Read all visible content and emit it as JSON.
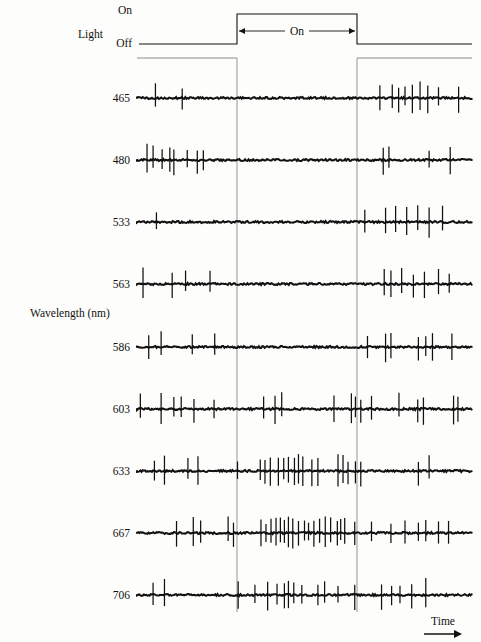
{
  "figure": {
    "y_axis_label": "Wavelength  (nm)",
    "x_axis_label": "Time",
    "stimulus_label": "Light",
    "stimulus_on_label": "On",
    "stimulus_off_label": "Off",
    "stimulus_span_label": "On",
    "ink_color": "#111111",
    "guide_color": "#8a8a8a"
  },
  "chart_data": {
    "type": "line",
    "title": "",
    "subtitle": "",
    "xlabel": "Time",
    "ylabel": "Wavelength  (nm)",
    "legend": [],
    "grid": false,
    "annotations": [
      "Light",
      "On",
      "Off",
      "On"
    ],
    "stimulus": {
      "name": "Light",
      "states": [
        "Off",
        "On"
      ],
      "on_start_px": 237,
      "on_end_px": 357,
      "trace_start_px": 137,
      "trace_end_px": 472,
      "off_level_px": 44,
      "on_level_px": 14
    },
    "categories": [
      "465",
      "480",
      "533",
      "563",
      "586",
      "603",
      "633",
      "667",
      "706"
    ],
    "series": [
      {
        "name": "465",
        "wavelength_nm": 465,
        "baseline_y_px": 98,
        "response_type": "off-response",
        "spikes_before": [
          0.055,
          0.135
        ],
        "spikes_during": [],
        "spikes_after": [
          0.725,
          0.762,
          0.781,
          0.8,
          0.822,
          0.845,
          0.868,
          0.9,
          0.96
        ],
        "spike_count": 11
      },
      {
        "name": "480",
        "wavelength_nm": 480,
        "baseline_y_px": 160,
        "response_type": "off-response",
        "spikes_before": [
          0.03,
          0.048,
          0.075,
          0.098,
          0.11,
          0.15,
          0.18,
          0.198
        ],
        "spikes_during": [],
        "spikes_after": [
          0.735,
          0.752,
          0.872,
          0.935
        ],
        "spike_count": 12
      },
      {
        "name": "533",
        "wavelength_nm": 533,
        "baseline_y_px": 222,
        "response_type": "off-response",
        "spikes_before": [
          0.058
        ],
        "spikes_during": [],
        "spikes_after": [
          0.68,
          0.742,
          0.772,
          0.805,
          0.838,
          0.872,
          0.912
        ],
        "spike_count": 8
      },
      {
        "name": "563",
        "wavelength_nm": 563,
        "baseline_y_px": 284,
        "response_type": "off-response",
        "spikes_before": [
          0.018,
          0.105,
          0.145,
          0.218
        ],
        "spikes_during": [],
        "spikes_after": [
          0.738,
          0.758,
          0.79,
          0.825,
          0.858,
          0.9,
          0.932
        ],
        "spike_count": 11
      },
      {
        "name": "586",
        "wavelength_nm": 586,
        "baseline_y_px": 347,
        "response_type": "off-response",
        "spikes_before": [
          0.035,
          0.072,
          0.165,
          0.232
        ],
        "spikes_during": [],
        "spikes_after": [
          0.688,
          0.742,
          0.758,
          0.84,
          0.862,
          0.882,
          0.94
        ],
        "spike_count": 11
      },
      {
        "name": "603",
        "wavelength_nm": 603,
        "baseline_y_px": 409,
        "response_type": "mixed",
        "spikes_before": [
          0.01,
          0.072,
          0.11,
          0.132,
          0.17,
          0.23
        ],
        "spikes_during": [
          0.378,
          0.412,
          0.432
        ],
        "spikes_after": [
          0.588,
          0.64,
          0.652,
          0.668,
          0.7,
          0.782,
          0.838,
          0.855,
          0.945,
          0.958
        ],
        "spike_count": 19
      },
      {
        "name": "633",
        "wavelength_nm": 633,
        "baseline_y_px": 471,
        "response_type": "on-response",
        "spikes_before": [
          0.052,
          0.082,
          0.152,
          0.182
        ],
        "spikes_during": [
          0.3,
          0.368,
          0.382,
          0.398,
          0.422,
          0.438,
          0.452,
          0.47,
          0.482,
          0.495,
          0.522,
          0.54
        ],
        "spikes_after": [
          0.6,
          0.615,
          0.63,
          0.652,
          0.668,
          0.84,
          0.872
        ],
        "spike_count": 23
      },
      {
        "name": "667",
        "wavelength_nm": 667,
        "baseline_y_px": 533,
        "response_type": "on-response",
        "spikes_before": [
          0.118,
          0.168,
          0.19
        ],
        "spikes_during": [
          0.272,
          0.288,
          0.37,
          0.385,
          0.4,
          0.415,
          0.428,
          0.44,
          0.452,
          0.465,
          0.482,
          0.5,
          0.512,
          0.528,
          0.545,
          0.562,
          0.578
        ],
        "spikes_after": [
          0.598,
          0.608,
          0.62,
          0.65,
          0.7,
          0.758,
          0.8,
          0.84,
          0.862,
          0.9,
          0.93
        ],
        "spike_count": 31
      },
      {
        "name": "706",
        "wavelength_nm": 706,
        "baseline_y_px": 595,
        "response_type": "on-response",
        "spikes_before": [
          0.048,
          0.082
        ],
        "spikes_during": [
          0.302,
          0.352,
          0.39,
          0.418,
          0.44,
          0.452,
          0.468,
          0.492,
          0.54,
          0.56
        ],
        "spikes_after": [
          0.6,
          0.65,
          0.73,
          0.76,
          0.785,
          0.82,
          0.862
        ],
        "spike_count": 19
      }
    ]
  }
}
